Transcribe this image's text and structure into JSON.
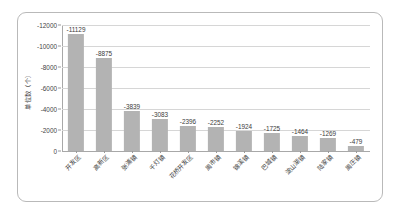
{
  "chart_data": {
    "type": "bar",
    "title": "",
    "xlabel": "",
    "ylabel": "单位数（个）",
    "categories": [
      "开发区",
      "高新区",
      "张浦镇",
      "千灯镇",
      "花桥开发区",
      "周市镇",
      "锦溪镇",
      "巴城镇",
      "淀山湖镇",
      "陆家镇",
      "周庄镇"
    ],
    "values": [
      -11129,
      -8875,
      -3839,
      -3083,
      -2396,
      -2252,
      -1924,
      -1725,
      -1464,
      -1269,
      -479
    ],
    "value_labels": [
      "-11129",
      "-8875",
      "-3839",
      "-3083",
      "-2396",
      "-2252",
      "-1924",
      "-1725",
      "-1464",
      "-1269",
      "-479"
    ],
    "ylim": [
      0,
      -12000
    ],
    "yticks": [
      0,
      -2000,
      -4000,
      -6000,
      -8000,
      -10000,
      -12000
    ],
    "ytick_labels": [
      "0",
      "-2000",
      "-4000",
      "-6000",
      "-8000",
      "-10000",
      "-12000"
    ],
    "y_axis_inverted": true,
    "grid": true,
    "legend": false,
    "legend_position": "none",
    "bar_color": "#b3b3b3",
    "grid_color": "#d6d6d6",
    "axis_color": "#a8a8a8",
    "text_color": "#3b3b3b",
    "border_color": "#b9b9b9"
  }
}
